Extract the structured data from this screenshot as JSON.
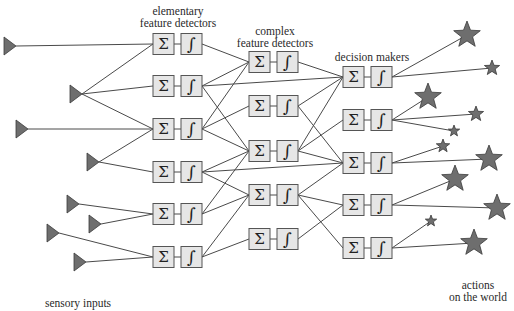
{
  "labels": {
    "elementary_line1": "elementary",
    "elementary_line2": "feature detectors",
    "complex_line1": "complex",
    "complex_line2": "feature detectors",
    "decision": "decision makers",
    "sensory": "sensory inputs",
    "actions_line1": "actions",
    "actions_line2": "on the world"
  },
  "symbols": {
    "sum": "Σ",
    "integral": "∫"
  },
  "colors": {
    "line": "#4a4a4a",
    "box_fill": "#e6e6e6",
    "box_stroke": "#555555",
    "marker_fill": "#6e6e6e",
    "marker_stroke": "#3a3a3a"
  },
  "sensors": [
    {
      "tip": [
        16,
        46
      ]
    },
    {
      "tip": [
        82,
        94
      ]
    },
    {
      "tip": [
        28,
        129
      ]
    },
    {
      "tip": [
        99,
        162
      ]
    },
    {
      "tip": [
        79,
        204
      ]
    },
    {
      "tip": [
        101,
        224
      ]
    },
    {
      "tip": [
        59,
        233
      ]
    },
    {
      "tip": [
        86,
        262
      ]
    }
  ],
  "layers": [
    {
      "name": "elementary feature detectors",
      "sum_x": 153,
      "int_x": 181,
      "rows": [
        44,
        86,
        129,
        172,
        214,
        257
      ]
    },
    {
      "name": "complex feature detectors",
      "sum_x": 249,
      "int_x": 277,
      "rows": [
        62,
        106,
        151,
        195,
        239
      ]
    },
    {
      "name": "decision makers",
      "sum_x": 343,
      "int_x": 371,
      "rows": [
        77,
        120,
        163,
        205,
        248
      ]
    }
  ],
  "stars": [
    {
      "c": [
        467,
        35
      ],
      "r": 14
    },
    {
      "c": [
        492,
        68
      ],
      "r": 8
    },
    {
      "c": [
        428,
        97
      ],
      "r": 14
    },
    {
      "c": [
        476,
        114
      ],
      "r": 8
    },
    {
      "c": [
        454,
        131
      ],
      "r": 6
    },
    {
      "c": [
        443,
        146
      ],
      "r": 7
    },
    {
      "c": [
        489,
        159
      ],
      "r": 14
    },
    {
      "c": [
        455,
        179
      ],
      "r": 14
    },
    {
      "c": [
        497,
        208
      ],
      "r": 14
    },
    {
      "c": [
        431,
        221
      ],
      "r": 6
    },
    {
      "c": [
        474,
        243
      ],
      "r": 14
    }
  ],
  "edges": {
    "sensor_to_l1": [
      [
        0,
        0
      ],
      [
        1,
        0
      ],
      [
        1,
        1
      ],
      [
        1,
        2
      ],
      [
        2,
        2
      ],
      [
        3,
        2
      ],
      [
        3,
        3
      ],
      [
        4,
        4
      ],
      [
        5,
        4
      ],
      [
        6,
        5
      ],
      [
        7,
        5
      ]
    ],
    "l1_to_l2": [
      [
        0,
        0
      ],
      [
        1,
        0
      ],
      [
        1,
        2
      ],
      [
        2,
        0
      ],
      [
        2,
        1
      ],
      [
        2,
        2
      ],
      [
        3,
        2
      ],
      [
        3,
        3
      ],
      [
        4,
        2
      ],
      [
        4,
        3
      ],
      [
        5,
        3
      ],
      [
        5,
        4
      ]
    ],
    "l1_to_l3": [
      [
        1,
        0
      ],
      [
        3,
        2
      ]
    ],
    "l2_to_l3": [
      [
        0,
        0
      ],
      [
        1,
        0
      ],
      [
        1,
        2
      ],
      [
        2,
        0
      ],
      [
        2,
        1
      ],
      [
        2,
        2
      ],
      [
        3,
        2
      ],
      [
        3,
        3
      ],
      [
        3,
        4
      ],
      [
        4,
        3
      ]
    ],
    "l3_to_star": [
      [
        0,
        0
      ],
      [
        0,
        1
      ],
      [
        1,
        2
      ],
      [
        1,
        3
      ],
      [
        1,
        4
      ],
      [
        2,
        5
      ],
      [
        2,
        6
      ],
      [
        3,
        7
      ],
      [
        3,
        8
      ],
      [
        4,
        9
      ],
      [
        4,
        10
      ]
    ]
  }
}
